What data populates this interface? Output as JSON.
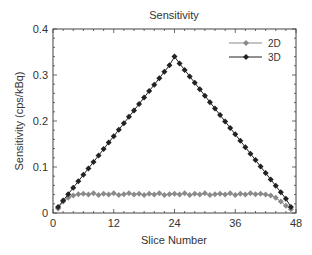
{
  "chart_data": {
    "type": "line",
    "title": "Sensitivity",
    "xlabel": "Slice Number",
    "ylabel": "Sensitivity (cps/kBq)",
    "xlim": [
      0,
      48
    ],
    "ylim": [
      0,
      0.4
    ],
    "xticks": [
      "0",
      "12",
      "24",
      "36",
      "48"
    ],
    "yticks": [
      "0",
      "0.1",
      "0.2",
      "0.3",
      "0.4"
    ],
    "legend_position": "upper right",
    "grid": false,
    "x": [
      1,
      2,
      3,
      4,
      5,
      6,
      7,
      8,
      9,
      10,
      11,
      12,
      13,
      14,
      15,
      16,
      17,
      18,
      19,
      20,
      21,
      22,
      23,
      24,
      25,
      26,
      27,
      28,
      29,
      30,
      31,
      32,
      33,
      34,
      35,
      36,
      37,
      38,
      39,
      40,
      41,
      42,
      43,
      44,
      45,
      46,
      47
    ],
    "series": [
      {
        "name": "2D",
        "color": "#8a8a8a",
        "values": [
          0.01,
          0.025,
          0.033,
          0.038,
          0.041,
          0.042,
          0.04,
          0.043,
          0.039,
          0.042,
          0.04,
          0.043,
          0.039,
          0.041,
          0.043,
          0.04,
          0.042,
          0.039,
          0.042,
          0.04,
          0.043,
          0.039,
          0.041,
          0.042,
          0.04,
          0.043,
          0.039,
          0.042,
          0.04,
          0.043,
          0.039,
          0.041,
          0.042,
          0.04,
          0.043,
          0.039,
          0.042,
          0.04,
          0.043,
          0.041,
          0.042,
          0.04,
          0.038,
          0.033,
          0.025,
          0.016,
          0.008
        ]
      },
      {
        "name": "3D",
        "color": "#222222",
        "values": [
          0.013,
          0.027,
          0.041,
          0.055,
          0.069,
          0.083,
          0.097,
          0.111,
          0.125,
          0.139,
          0.153,
          0.167,
          0.181,
          0.195,
          0.209,
          0.223,
          0.237,
          0.251,
          0.265,
          0.279,
          0.293,
          0.307,
          0.321,
          0.34,
          0.325,
          0.311,
          0.297,
          0.283,
          0.269,
          0.255,
          0.241,
          0.227,
          0.213,
          0.199,
          0.185,
          0.171,
          0.157,
          0.143,
          0.129,
          0.115,
          0.101,
          0.087,
          0.073,
          0.059,
          0.045,
          0.031,
          0.013
        ]
      }
    ]
  }
}
